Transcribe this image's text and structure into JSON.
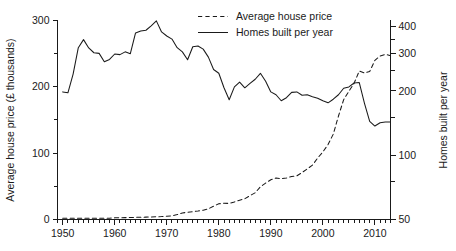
{
  "chart_data": {
    "type": "line",
    "title": "",
    "xlabel": "",
    "ylabel": "Average house price (£ thousands)",
    "y2label": "Homes built per year",
    "grid": false,
    "legend_position": "top-center",
    "xlim": [
      1949,
      2013
    ],
    "ylim": [
      0,
      300
    ],
    "y2lim": [
      50,
      430
    ],
    "y2_scale": "log",
    "xticks": [
      1950,
      1960,
      1970,
      1980,
      1990,
      2000,
      2010
    ],
    "xtick_labels": [
      "1950",
      "1960",
      "1970",
      "1980",
      "1990",
      "2000",
      "2010"
    ],
    "xtick_minor_step": 1,
    "yticks": [
      0,
      50,
      100,
      150,
      200,
      250,
      300
    ],
    "ytick_labels": [
      "0",
      "",
      "100",
      "",
      "200",
      "",
      "300"
    ],
    "y2ticks": [
      50,
      75,
      100,
      150,
      200,
      250,
      300,
      350,
      400
    ],
    "y2tick_labels": [
      "50",
      "",
      "100",
      "",
      "200",
      "",
      "300",
      "",
      "400"
    ],
    "series": [
      {
        "name": "Average house price",
        "axis": "left",
        "style": "dashed",
        "units": "£ thousands",
        "x": [
          1950,
          1951,
          1952,
          1953,
          1954,
          1955,
          1956,
          1957,
          1958,
          1959,
          1960,
          1961,
          1962,
          1963,
          1964,
          1965,
          1966,
          1967,
          1968,
          1969,
          1970,
          1971,
          1972,
          1973,
          1974,
          1975,
          1976,
          1977,
          1978,
          1979,
          1980,
          1981,
          1982,
          1983,
          1984,
          1985,
          1986,
          1987,
          1988,
          1989,
          1990,
          1991,
          1992,
          1993,
          1994,
          1995,
          1996,
          1997,
          1998,
          1999,
          2000,
          2001,
          2002,
          2003,
          2004,
          2005,
          2006,
          2007,
          2008,
          2009,
          2010,
          2011,
          2012,
          2013
        ],
        "values": [
          2,
          2,
          2,
          2,
          2,
          2,
          2,
          2,
          2,
          2,
          2.5,
          2.6,
          2.8,
          3,
          3.2,
          3.4,
          3.6,
          3.8,
          4.1,
          4.4,
          4.9,
          5.6,
          7.4,
          9.8,
          10.9,
          11.8,
          12.7,
          13.9,
          16,
          20.1,
          23.6,
          24.5,
          24.2,
          26.5,
          29.1,
          31.2,
          36,
          40.2,
          49.3,
          54.8,
          59.8,
          62.5,
          61.3,
          62.3,
          64.7,
          65.6,
          70.6,
          76.1,
          81.8,
          92.5,
          101.6,
          112.8,
          128.3,
          155.6,
          180.2,
          192.7,
          204.8,
          223.4,
          220.2,
          222.5,
          239.4,
          245.8,
          248.4,
          246.3
        ]
      },
      {
        "name": "Homes built per year",
        "axis": "right",
        "style": "solid",
        "units": "thousands of homes",
        "x": [
          1950,
          1951,
          1952,
          1953,
          1954,
          1955,
          1956,
          1957,
          1958,
          1959,
          1960,
          1961,
          1962,
          1963,
          1964,
          1965,
          1966,
          1967,
          1968,
          1969,
          1970,
          1971,
          1972,
          1973,
          1974,
          1975,
          1976,
          1977,
          1978,
          1979,
          1980,
          1981,
          1982,
          1983,
          1984,
          1985,
          1986,
          1987,
          1988,
          1989,
          1990,
          1991,
          1992,
          1993,
          1994,
          1995,
          1996,
          1997,
          1998,
          1999,
          2000,
          2001,
          2002,
          2003,
          2004,
          2005,
          2006,
          2007,
          2008,
          2009,
          2010,
          2011,
          2012,
          2013
        ],
        "values": [
          198,
          196,
          240,
          319,
          348,
          318,
          302,
          300,
          274,
          281,
          298,
          296,
          305,
          299,
          374,
          382,
          385,
          404,
          426,
          378,
          362,
          350,
          319,
          305,
          280,
          322,
          325,
          314,
          288,
          252,
          242,
          207,
          182,
          209,
          220,
          207,
          217,
          227,
          242,
          222,
          198,
          192,
          180,
          186,
          197,
          198,
          191,
          192,
          188,
          185,
          180,
          176,
          183,
          192,
          206,
          209,
          218,
          219,
          175,
          144,
          137,
          142,
          143,
          143
        ]
      }
    ]
  },
  "legend": {
    "items": [
      {
        "label": "Average house price",
        "style": "dashed"
      },
      {
        "label": "Homes built per year",
        "style": "solid"
      }
    ]
  },
  "axes": {
    "left_title": "Average house price (£ thousands)",
    "right_title": "Homes built per year"
  }
}
